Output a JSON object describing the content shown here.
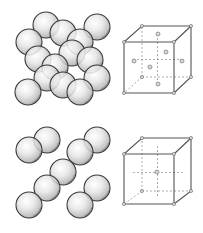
{
  "colors": {
    "background": "#ffffff",
    "sphere_stroke": "#3a3a3a",
    "sphere_light": "#f4f4f4",
    "sphere_dark": "#9a9a9a",
    "cube_edge": "#555555",
    "cube_hidden": "#8a8a8a",
    "node_fill": "#d8d8d8"
  },
  "sphere_radius": 13,
  "structures": [
    {
      "name": "face-centered-cubic",
      "spheres": [
        [
          46,
          25
        ],
        [
          97,
          27
        ],
        [
          63,
          33
        ],
        [
          29,
          42
        ],
        [
          80,
          42
        ],
        [
          72,
          53
        ],
        [
          38,
          59
        ],
        [
          90,
          60
        ],
        [
          55,
          67
        ],
        [
          47,
          78
        ],
        [
          97,
          78
        ],
        [
          63,
          85
        ],
        [
          28,
          92
        ],
        [
          80,
          92
        ]
      ],
      "cube": {
        "front": [
          [
            124,
            42
          ],
          [
            174,
            42
          ],
          [
            174,
            93
          ],
          [
            124,
            93
          ]
        ],
        "back": [
          [
            142,
            26
          ],
          [
            191,
            26
          ],
          [
            191,
            77
          ],
          [
            142,
            77
          ]
        ],
        "centers": [
          [
            158,
            34
          ],
          [
            150,
            67
          ],
          [
            182,
            61
          ],
          [
            134,
            61
          ],
          [
            166,
            52
          ],
          [
            158,
            84
          ]
        ]
      }
    },
    {
      "name": "body-centered-cubic",
      "spheres": [
        [
          47,
          140
        ],
        [
          97,
          140
        ],
        [
          29,
          150
        ],
        [
          80,
          152
        ],
        [
          63,
          172
        ],
        [
          47,
          188
        ],
        [
          97,
          188
        ],
        [
          29,
          205
        ],
        [
          80,
          205
        ]
      ],
      "cube": {
        "front": [
          [
            124,
            154
          ],
          [
            174,
            154
          ],
          [
            174,
            204
          ],
          [
            124,
            204
          ]
        ],
        "back": [
          [
            142,
            138
          ],
          [
            191,
            138
          ],
          [
            191,
            191
          ],
          [
            142,
            191
          ]
        ],
        "centers": [
          [
            157,
            172
          ]
        ]
      }
    }
  ]
}
